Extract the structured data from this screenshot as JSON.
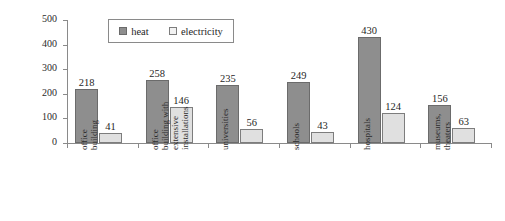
{
  "chart_data": {
    "type": "bar",
    "title": "",
    "xlabel": "",
    "ylabel": "energy consumption [kWh/m²a]",
    "ylim": [
      0,
      500
    ],
    "ytick_labels": [
      "0",
      "100",
      "200",
      "300",
      "400",
      "500"
    ],
    "ytick_values": [
      0,
      100,
      200,
      300,
      400,
      500
    ],
    "grid": false,
    "legend_position": "top-left-inside",
    "categories": [
      "office building",
      "office building with extensive installations",
      "universities",
      "schools",
      "hospitals",
      "museums, theaters"
    ],
    "category_lines": [
      [
        "office",
        "building"
      ],
      [
        "office",
        "building with",
        "extensive",
        "installations"
      ],
      [
        "universities"
      ],
      [
        "schools"
      ],
      [
        "hospitals"
      ],
      [
        "museums,",
        "theaters"
      ]
    ],
    "series": [
      {
        "name": "heat",
        "color": "#8e8e8e",
        "values": [
          218,
          258,
          235,
          249,
          430,
          156
        ],
        "labels": [
          "218",
          "258",
          "235",
          "249",
          "430",
          "156"
        ]
      },
      {
        "name": "electricity",
        "color": "#e0e0e0",
        "values": [
          41,
          146,
          56,
          43,
          124,
          63
        ],
        "labels": [
          "41",
          "146",
          "56",
          "43",
          "124",
          "63"
        ]
      }
    ]
  },
  "legend": {
    "entries": [
      {
        "label": "heat",
        "swatch": "heat"
      },
      {
        "label": "electricity",
        "swatch": "elec"
      }
    ]
  }
}
